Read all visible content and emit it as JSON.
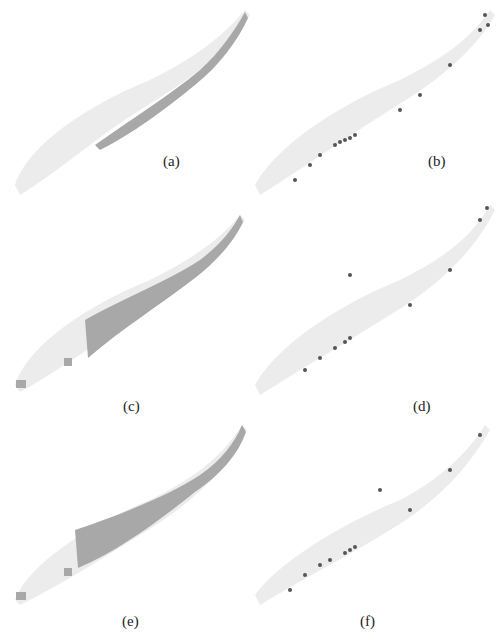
{
  "figure": {
    "panels": [
      {
        "id": "a",
        "label": "(a)",
        "type": "region"
      },
      {
        "id": "b",
        "label": "(b)",
        "type": "points"
      },
      {
        "id": "c",
        "label": "(c)",
        "type": "region"
      },
      {
        "id": "d",
        "label": "(d)",
        "type": "points"
      },
      {
        "id": "e",
        "label": "(e)",
        "type": "region"
      },
      {
        "id": "f",
        "label": "(f)",
        "type": "points"
      }
    ],
    "colors": {
      "background_shape": "#ececec",
      "region_fill": "#a8a8a8",
      "point_fill": "#555555"
    }
  }
}
